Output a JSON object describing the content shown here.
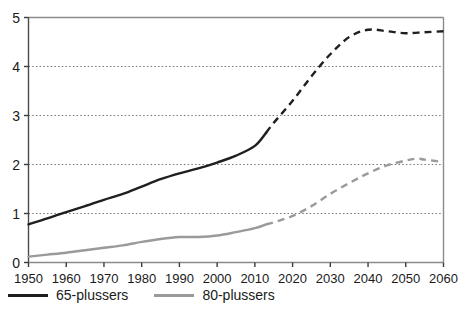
{
  "chart_data": {
    "type": "line",
    "title": "",
    "subtitle": "",
    "xlabel": "",
    "ylabel": "",
    "xlim": [
      1950,
      2060
    ],
    "ylim": [
      0,
      5
    ],
    "grid": true,
    "grid_axis": "y",
    "legend_position": "bottom-left",
    "x_ticks": [
      1950,
      1960,
      1970,
      1980,
      1990,
      2000,
      2010,
      2020,
      2030,
      2040,
      2050,
      2060
    ],
    "x_tick_labels": [
      "1950",
      "1960",
      "1970",
      "1980",
      "1990",
      "2000",
      "2010",
      "2020",
      "2030",
      "2040",
      "2050",
      "2060"
    ],
    "y_ticks": [
      0,
      1,
      2,
      3,
      4,
      5
    ],
    "y_tick_labels": [
      "0",
      "1",
      "2",
      "3",
      "4",
      "5"
    ],
    "historical_end_year": 2013,
    "series": [
      {
        "name": "65-plussers",
        "color": "#1f1f1f",
        "linewidth": 2.4,
        "x": [
          1950,
          1955,
          1960,
          1965,
          1970,
          1975,
          1980,
          1985,
          1990,
          1995,
          2000,
          2005,
          2010,
          2013,
          2015,
          2020,
          2025,
          2030,
          2035,
          2040,
          2045,
          2050,
          2055,
          2060
        ],
        "values": [
          0.78,
          0.9,
          1.03,
          1.15,
          1.28,
          1.4,
          1.55,
          1.7,
          1.82,
          1.92,
          2.04,
          2.18,
          2.38,
          2.65,
          2.85,
          3.3,
          3.8,
          4.25,
          4.6,
          4.75,
          4.72,
          4.68,
          4.7,
          4.72
        ]
      },
      {
        "name": "80-plussers",
        "color": "#9a9a9a",
        "linewidth": 2.4,
        "x": [
          1950,
          1955,
          1960,
          1965,
          1970,
          1975,
          1980,
          1985,
          1990,
          1995,
          2000,
          2005,
          2010,
          2013,
          2015,
          2020,
          2025,
          2030,
          2035,
          2040,
          2045,
          2050,
          2053,
          2055,
          2060
        ],
        "values": [
          0.12,
          0.16,
          0.2,
          0.25,
          0.3,
          0.35,
          0.42,
          0.48,
          0.52,
          0.52,
          0.55,
          0.62,
          0.7,
          0.78,
          0.82,
          0.95,
          1.15,
          1.4,
          1.62,
          1.82,
          1.98,
          2.08,
          2.12,
          2.1,
          2.05
        ]
      }
    ]
  },
  "legend": {
    "entries": [
      {
        "label": "65-plussers",
        "color": "#1f1f1f"
      },
      {
        "label": "80-plussers",
        "color": "#9a9a9a"
      }
    ]
  }
}
